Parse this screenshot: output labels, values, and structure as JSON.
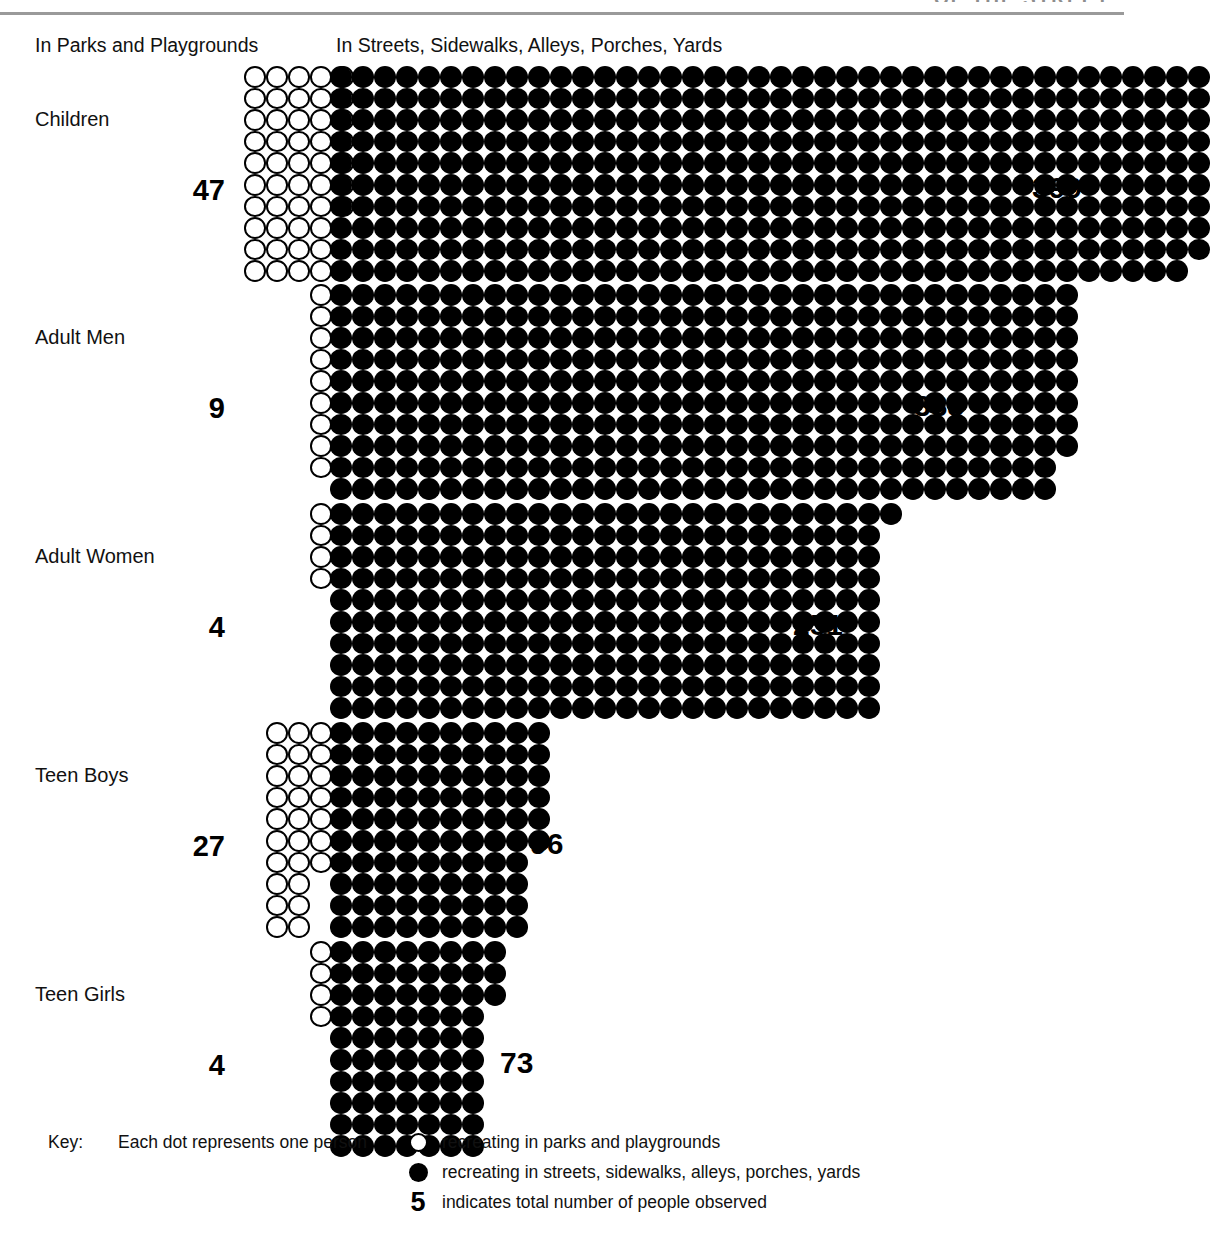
{
  "header": {
    "clipped_top_text": "OF THE STREET",
    "column_parks": "In Parks and Playgrounds",
    "column_streets": "In Streets, Sidewalks, Alleys, Porches, Yards"
  },
  "key": {
    "title": "Key:",
    "lead": "Each dot represents one person",
    "rows": [
      {
        "glyph": "open-circle",
        "glyph_label": "O",
        "text": "recreating in parks and playgrounds"
      },
      {
        "glyph": "filled-dot",
        "glyph_label": "●",
        "text": "recreating in streets, sidewalks, alleys, porches, yards"
      },
      {
        "glyph": "number",
        "glyph_label": "5",
        "text": "indicates total number of people observed"
      }
    ]
  },
  "chart_data": {
    "type": "bar",
    "subtype": "isotype-dot-matrix",
    "title": "",
    "xlabel": "",
    "ylabel": "",
    "unit": "1 dot = 1 person observed",
    "rows_per_column": 10,
    "categories": [
      "Children",
      "Adult Men",
      "Adult Women",
      "Teen Boys",
      "Teen Girls"
    ],
    "series": [
      {
        "name": "In Parks and Playgrounds",
        "marker": "open-circle",
        "values": [
          47,
          9,
          4,
          27,
          4
        ]
      },
      {
        "name": "In Streets, Sidewalks, Alleys, Porches, Yards",
        "marker": "filled-dot",
        "values": [
          399,
          338,
          251,
          96,
          73
        ]
      }
    ],
    "groups": [
      {
        "label": "Children",
        "parks": 47,
        "parks_label": "47",
        "streets": 399,
        "streets_label": "399"
      },
      {
        "label": "Adult Men",
        "parks": 9,
        "parks_label": "9",
        "streets": 338,
        "streets_label": "338"
      },
      {
        "label": "Adult Women",
        "parks": 4,
        "parks_label": "4",
        "streets": 251,
        "streets_label": "251"
      },
      {
        "label": "Teen Boys",
        "parks": 27,
        "parks_label": "27",
        "streets": 96,
        "streets_label": "96"
      },
      {
        "label": "Teen Girls",
        "parks": 4,
        "parks_label": "4",
        "streets": 73,
        "streets_label": "73"
      }
    ]
  },
  "colors": {
    "ink": "#000000",
    "paper": "#ffffff",
    "rule": "#9a9a9a"
  }
}
